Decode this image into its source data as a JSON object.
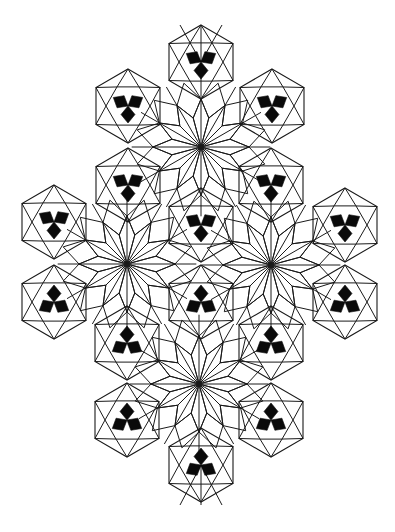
{
  "figure": {
    "title": "",
    "colors": {
      "line": "#1a1a1a",
      "fill_motif": "#0a0a0a",
      "background": "#ffffff"
    },
    "rosettes": [
      {
        "id": "top",
        "rays": 12
      },
      {
        "id": "left",
        "rays": 12
      },
      {
        "id": "right",
        "rays": 12
      },
      {
        "id": "bottom",
        "rays": 12
      }
    ],
    "trefoils": [
      {
        "id": "t1",
        "orientation": "down"
      },
      {
        "id": "t2",
        "orientation": "down"
      },
      {
        "id": "t3",
        "orientation": "down"
      },
      {
        "id": "t4",
        "orientation": "down"
      },
      {
        "id": "t5",
        "orientation": "down"
      },
      {
        "id": "t6",
        "orientation": "down"
      },
      {
        "id": "t7",
        "orientation": "down"
      },
      {
        "id": "t8",
        "orientation": "down"
      },
      {
        "id": "t9",
        "orientation": "up"
      },
      {
        "id": "t10",
        "orientation": "up"
      },
      {
        "id": "t11",
        "orientation": "up"
      },
      {
        "id": "t12",
        "orientation": "up"
      },
      {
        "id": "t13",
        "orientation": "up"
      },
      {
        "id": "t14",
        "orientation": "up"
      },
      {
        "id": "t15",
        "orientation": "up"
      },
      {
        "id": "t16",
        "orientation": "up"
      }
    ]
  }
}
